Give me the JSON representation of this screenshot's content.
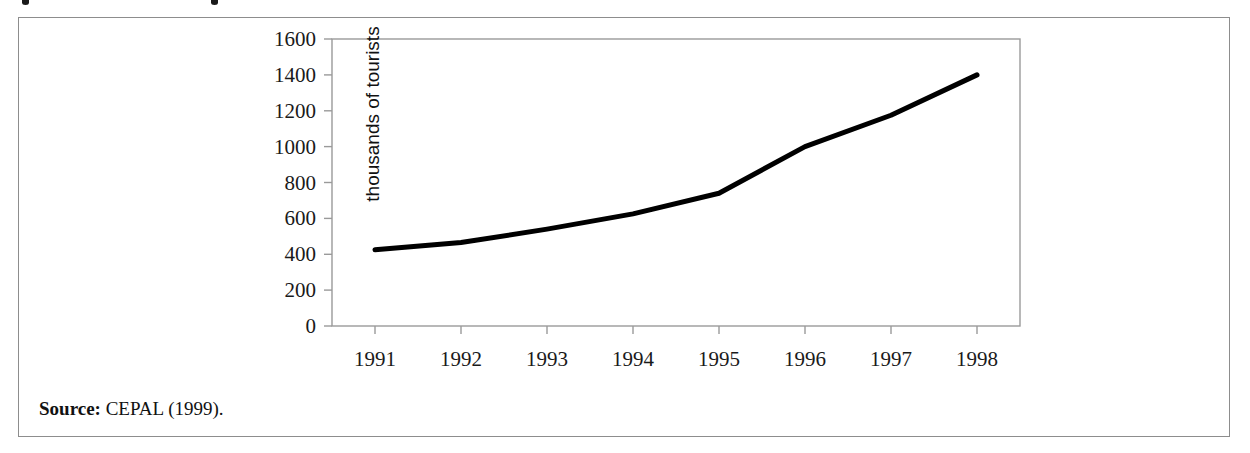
{
  "figure": {
    "source_label": "Source:",
    "source_value": "CEPAL (1999).",
    "border_color": "#8d8d8d",
    "background_color": "#ffffff"
  },
  "chart_data": {
    "type": "line",
    "title": "",
    "subtitle": "",
    "xlabel": "",
    "ylabel": "thousands of tourists",
    "categories": [
      "1991",
      "1992",
      "1993",
      "1994",
      "1995",
      "1996",
      "1997",
      "1998"
    ],
    "x": [
      1991,
      1992,
      1993,
      1994,
      1995,
      1996,
      1997,
      1998
    ],
    "values": [
      425,
      465,
      540,
      625,
      740,
      1000,
      1175,
      1400
    ],
    "series": [
      {
        "name": "tourist arrivals",
        "values": [
          425,
          465,
          540,
          625,
          740,
          1000,
          1175,
          1400
        ],
        "color": "#000000",
        "line_width": 5,
        "markers": false
      }
    ],
    "ylim": [
      0,
      1600
    ],
    "y_ticks": [
      0,
      200,
      400,
      600,
      800,
      1000,
      1200,
      1400,
      1600
    ],
    "y_tick_labels": [
      "0",
      "200",
      "400",
      "600",
      "800",
      "1000",
      "1200",
      "1400",
      "1600"
    ],
    "x_tick_labels": [
      "1991",
      "1992",
      "1993",
      "1994",
      "1995",
      "1996",
      "1997",
      "1998"
    ],
    "grid": false,
    "legend": false,
    "legend_position": "none",
    "axis_color": "#9a9a9a",
    "frame": "full"
  }
}
